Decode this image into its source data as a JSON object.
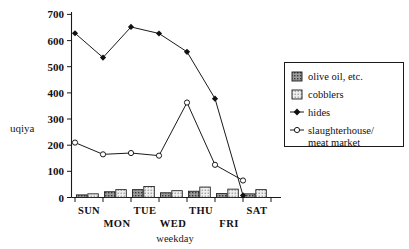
{
  "axis": {
    "y_title": "uqiya",
    "x_title": "weekday",
    "y_ticks": [
      "0",
      "100",
      "200",
      "300",
      "400",
      "500",
      "600",
      "700"
    ],
    "x_ticks": [
      "SUN",
      "MON",
      "TUE",
      "WED",
      "THU",
      "FRI",
      "SAT"
    ]
  },
  "legend": {
    "items": [
      {
        "label": "olive oil, etc.",
        "marker": "bar-swatch-dark-hatch"
      },
      {
        "label": "cobblers",
        "marker": "bar-swatch-light-dot"
      },
      {
        "label": "hides",
        "marker": "filled-diamond-line"
      },
      {
        "label": "slaughterhouse/",
        "label2": "meat  market",
        "marker": "open-circle-line"
      }
    ]
  },
  "colors": {
    "ink": "#1a1a1a",
    "background": "#ffffff",
    "olive_oil_fill": "#8a8a8a",
    "cobblers_fill": "#d8d8d8"
  },
  "chart_data": {
    "type": "bar",
    "title": "",
    "xlabel": "weekday",
    "ylabel": "uqiya",
    "ylim": [
      0,
      700
    ],
    "grid": false,
    "legend_position": "right",
    "categories": [
      "SUN",
      "MON",
      "TUE",
      "WED",
      "THU",
      "FRI",
      "SAT"
    ],
    "series": [
      {
        "name": "olive oil, etc.",
        "type": "bar",
        "values": [
          10,
          22,
          30,
          18,
          24,
          15,
          14
        ]
      },
      {
        "name": "cobblers",
        "type": "bar",
        "values": [
          14,
          30,
          42,
          26,
          40,
          32,
          30
        ]
      },
      {
        "name": "hides",
        "type": "line",
        "marker": "filled-diamond",
        "values": [
          628,
          535,
          652,
          627,
          557,
          378,
          8
        ]
      },
      {
        "name": "slaughterhouse/meat market",
        "type": "line",
        "marker": "open-circle",
        "values": [
          210,
          165,
          170,
          160,
          363,
          125,
          65
        ]
      }
    ]
  }
}
